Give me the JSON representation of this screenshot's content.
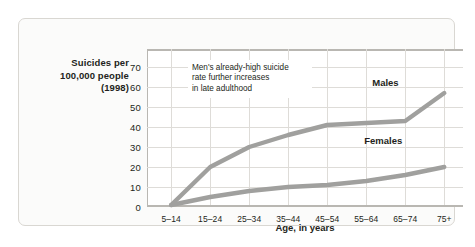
{
  "figure": {
    "y_axis_title": [
      "Suicides per",
      "100,000 people",
      "(1998)"
    ],
    "x_axis_title": "Age, in years",
    "annotation": [
      "Men's already-high suicide",
      "rate further increases",
      "in late adulthood"
    ],
    "annotation_text": "Men's already-high suicide rate further increases in late adulthood"
  },
  "colors": {
    "line": "#a0a09e",
    "grid": "#dedcd8",
    "axis": "#b9b7b2",
    "text": "#231f20",
    "panel": "#fbfbfa"
  },
  "chart_data": {
    "type": "line",
    "title": "",
    "subtitle": "",
    "xlabel": "Age, in years",
    "ylabel": "Suicides per 100,000 people (1998)",
    "categories": [
      "5–14",
      "15–24",
      "25–34",
      "35–44",
      "45–54",
      "55–64",
      "65–74",
      "75+"
    ],
    "yticks": [
      0,
      10,
      20,
      30,
      40,
      50,
      60,
      70
    ],
    "ylim": [
      0,
      79
    ],
    "xlim_note": "categorical, 8 evenly spaced points",
    "grid": true,
    "legend": "inline labels at right of each series",
    "series": [
      {
        "name": "Males",
        "values": [
          1,
          20,
          30,
          36,
          41,
          42,
          43,
          57
        ],
        "label_position": {
          "x": "75+ area",
          "y": 62
        }
      },
      {
        "name": "Females",
        "values": [
          1,
          5,
          8,
          10,
          11,
          13,
          16,
          20
        ],
        "label_position": {
          "x": "75+ area",
          "y": 33
        }
      }
    ],
    "annotations": [
      {
        "text": "Men's already-high suicide rate further increases in late adulthood",
        "anchor": "upper-left plot area"
      }
    ]
  }
}
